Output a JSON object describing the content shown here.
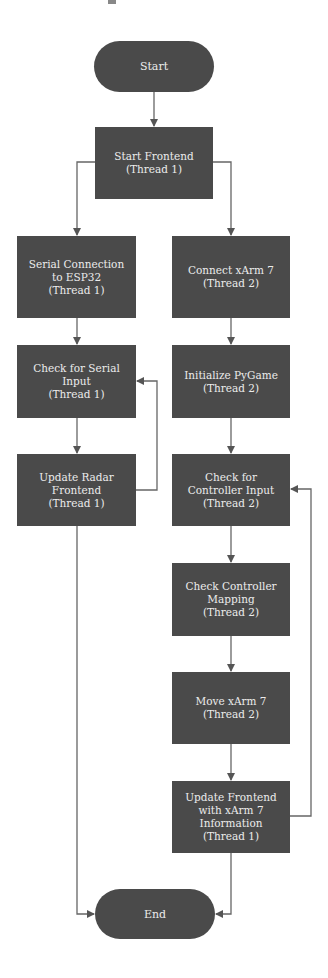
{
  "diagram": {
    "type": "flowchart",
    "colors": {
      "node_fill": "#4a4a4a",
      "node_text": "#ececec",
      "edge": "#555555",
      "background": "#ffffff"
    },
    "nodes": {
      "start": {
        "shape": "terminal",
        "lines": [
          "Start"
        ]
      },
      "frontend": {
        "shape": "process",
        "lines": [
          "Start Frontend",
          "(Thread 1)"
        ]
      },
      "serial": {
        "shape": "process",
        "lines": [
          "Serial Connection",
          "to ESP32",
          "(Thread 1)"
        ]
      },
      "xarm": {
        "shape": "process",
        "lines": [
          "Connect xArm 7",
          "(Thread 2)"
        ]
      },
      "checkser": {
        "shape": "process",
        "lines": [
          "Check for Serial",
          "Input",
          "(Thread 1)"
        ]
      },
      "pygame": {
        "shape": "process",
        "lines": [
          "Initialize PyGame",
          "(Thread 2)"
        ]
      },
      "radar": {
        "shape": "process",
        "lines": [
          "Update Radar",
          "Frontend",
          "(Thread 1)"
        ]
      },
      "ctrlinput": {
        "shape": "process",
        "lines": [
          "Check for",
          "Controller Input",
          "(Thread 2)"
        ]
      },
      "mapping": {
        "shape": "process",
        "lines": [
          "Check Controller",
          "Mapping",
          "(Thread 2)"
        ]
      },
      "move": {
        "shape": "process",
        "lines": [
          "Move xArm 7",
          "(Thread 2)"
        ]
      },
      "updfront": {
        "shape": "process",
        "lines": [
          "Update Frontend",
          "with xArm 7",
          "Information",
          "(Thread 1)"
        ]
      },
      "end": {
        "shape": "terminal",
        "lines": [
          "End"
        ]
      }
    },
    "edges": [
      [
        "Start",
        "Start Frontend"
      ],
      [
        "Start Frontend",
        "Serial Connection to ESP32"
      ],
      [
        "Start Frontend",
        "Connect xArm 7"
      ],
      [
        "Serial Connection to ESP32",
        "Check for Serial Input"
      ],
      [
        "Check for Serial Input",
        "Update Radar Frontend"
      ],
      [
        "Update Radar Frontend",
        "Check for Serial Input"
      ],
      [
        "Update Radar Frontend",
        "End"
      ],
      [
        "Connect xArm 7",
        "Initialize PyGame"
      ],
      [
        "Initialize PyGame",
        "Check for Controller Input"
      ],
      [
        "Check for Controller Input",
        "Check Controller Mapping"
      ],
      [
        "Check Controller Mapping",
        "Move xArm 7"
      ],
      [
        "Move xArm 7",
        "Update Frontend with xArm 7 Information"
      ],
      [
        "Update Frontend with xArm 7 Information",
        "Check for Controller Input"
      ],
      [
        "Update Frontend with xArm 7 Information",
        "End"
      ]
    ]
  }
}
